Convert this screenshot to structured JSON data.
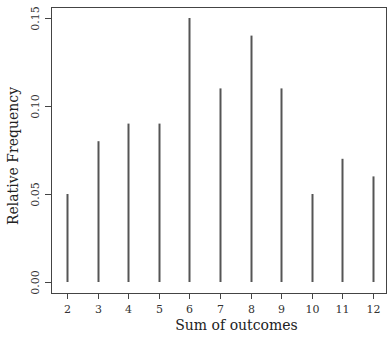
{
  "chart_data": {
    "type": "bar",
    "style": "vertical-lines (R type='h')",
    "title": "",
    "xlabel": "Sum of outcomes",
    "ylabel": "Relative Frequency",
    "categories": [
      "2",
      "3",
      "4",
      "5",
      "6",
      "7",
      "8",
      "9",
      "10",
      "11",
      "12"
    ],
    "x": [
      2,
      3,
      4,
      5,
      6,
      7,
      8,
      9,
      10,
      11,
      12
    ],
    "values": [
      0.05,
      0.08,
      0.09,
      0.09,
      0.15,
      0.11,
      0.14,
      0.11,
      0.05,
      0.07,
      0.06
    ],
    "ylim": [
      0,
      0.15
    ],
    "xlim": [
      2,
      12
    ],
    "yticks": [
      0.0,
      0.05,
      0.1,
      0.15
    ],
    "ytick_labels": [
      "0.00",
      "0.05",
      "0.10",
      "0.15"
    ],
    "xticks": [
      2,
      3,
      4,
      5,
      6,
      7,
      8,
      9,
      10,
      11,
      12
    ],
    "grid": false,
    "legend": null
  },
  "colors": {
    "bar": "#555555",
    "axis": "#444444",
    "text": "#333333"
  },
  "layout": {
    "box": {
      "left": 51,
      "top": 7,
      "right": 386,
      "bottom": 293
    },
    "x_px": {
      "min_val": 2,
      "min_px": 67,
      "max_val": 12,
      "max_px": 373
    },
    "y_px": {
      "min_val": 0,
      "min_px": 282,
      "max_val": 0.15,
      "max_px": 18
    }
  }
}
